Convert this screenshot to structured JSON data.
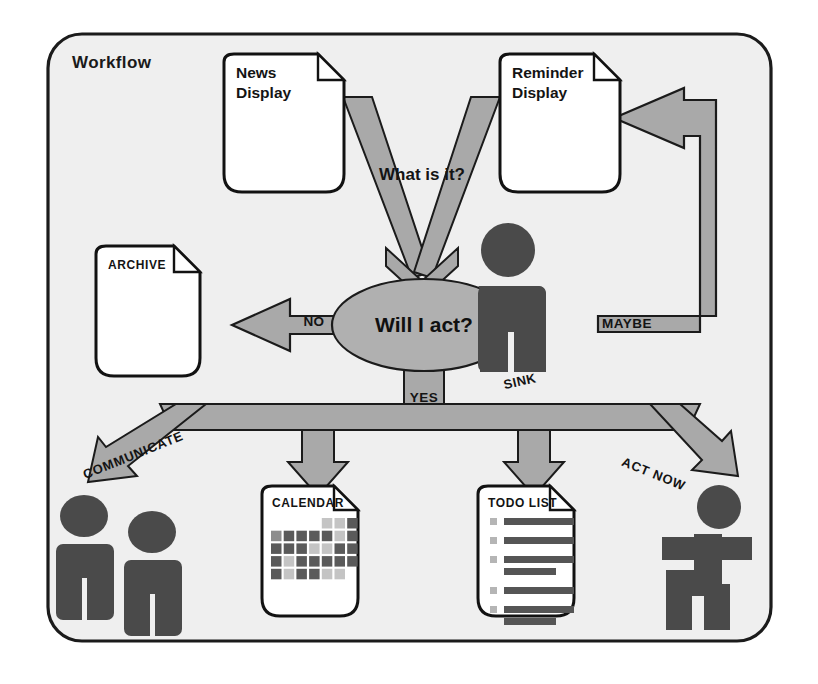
{
  "diagram": {
    "title": "Workflow",
    "frame": {
      "border_color": "#1b1b1b",
      "background_color": "#efefef",
      "page_color": "#ffffff"
    },
    "palette": {
      "arrow_gray": "#a9a9a9",
      "arrow_outline": "#1b1b1b",
      "decision_gray": "#b0b0b0",
      "figure_dark": "#4a4a4a",
      "note_fill": "#ffffff",
      "note_outline": "#121212",
      "text_dark": "#141414",
      "cell_dark": "#5a5a5a",
      "cell_mid": "#8d8d8d",
      "cell_light": "#c4c4c4",
      "bar_dark": "#555555",
      "bullet_gray": "#b5b5b5"
    },
    "inputs": [
      {
        "id": "news",
        "title_line1": "News",
        "title_line2": "Display",
        "shape": "note"
      },
      {
        "id": "reminder",
        "title_line1": "Reminder",
        "title_line2": "Display",
        "shape": "note"
      }
    ],
    "merge_arrow_label": "What is it?",
    "decision": {
      "label": "Will I act?",
      "shape": "ellipse"
    },
    "sink": {
      "label": "SINK",
      "icon": "person-standing-icon"
    },
    "branches": [
      {
        "id": "no",
        "label": "NO",
        "direction": "left",
        "target": "archive"
      },
      {
        "id": "maybe",
        "label": "MAYBE",
        "direction": "right-loop-up",
        "target": "reminder"
      },
      {
        "id": "yes",
        "label": "YES",
        "direction": "down",
        "target": "actions"
      }
    ],
    "action_labels": [
      {
        "id": "communicate",
        "label": "COMMUNICATE"
      },
      {
        "id": "act-now",
        "label": "ACT NOW"
      }
    ],
    "outputs": [
      {
        "id": "archive",
        "caption": "ARCHIVE",
        "shape": "note",
        "body": "empty"
      },
      {
        "id": "calendar",
        "caption": "CALENDAR",
        "shape": "note",
        "body": "month-grid"
      },
      {
        "id": "todo",
        "caption": "TODO LIST",
        "shape": "note",
        "body": "checklist"
      }
    ],
    "actors": [
      {
        "id": "communicate-people",
        "icon": "two-people-icon",
        "count": 2
      },
      {
        "id": "act-now-runner",
        "icon": "running-person-icon",
        "count": 1
      }
    ],
    "calendar_grid": {
      "columns": 7,
      "rows": 5,
      "start_offset": 4,
      "shades": [
        [
          null,
          null,
          null,
          null,
          "light",
          "light",
          "dark"
        ],
        [
          "mid",
          "dark",
          "dark",
          "dark",
          "dark",
          "light",
          "dark"
        ],
        [
          "dark",
          "dark",
          "dark",
          "light",
          "light",
          "dark",
          "dark"
        ],
        [
          "dark",
          "light",
          "dark",
          "dark",
          "dark",
          "dark",
          "dark"
        ],
        [
          "dark",
          "light",
          "dark",
          "dark",
          "light",
          "light",
          null
        ]
      ]
    },
    "todo_items": [
      {
        "lines": 1
      },
      {
        "lines": 1
      },
      {
        "lines": 2
      },
      {
        "lines": 1
      },
      {
        "lines": 2
      }
    ]
  }
}
